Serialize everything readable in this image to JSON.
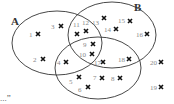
{
  "diagram": {
    "type": "venn",
    "sets": [
      {
        "id": "A",
        "label": "A",
        "cx": 57,
        "cy": 43,
        "rx": 45,
        "ry": 32,
        "label_x": 11,
        "label_y": 25
      },
      {
        "id": "B",
        "label": "B",
        "cx": 112,
        "cy": 35,
        "rx": 44,
        "ry": 33,
        "label_x": 134,
        "label_y": 11
      },
      {
        "id": "C",
        "label": "",
        "cx": 98,
        "cy": 68,
        "rx": 43,
        "ry": 31,
        "label_x": 0,
        "label_y": 0
      }
    ],
    "points": [
      {
        "n": "1",
        "x": 38,
        "y": 34,
        "tx": 29,
        "ty": 37
      },
      {
        "n": "2",
        "x": 43,
        "y": 59,
        "tx": 33,
        "ty": 62
      },
      {
        "n": "3",
        "x": 61,
        "y": 26,
        "tx": 51,
        "ty": 29
      },
      {
        "n": "4",
        "x": 66,
        "y": 62,
        "tx": 57,
        "ty": 65
      },
      {
        "n": "5",
        "x": 79,
        "y": 77,
        "tx": 69,
        "ty": 84
      },
      {
        "n": "6",
        "x": 88,
        "y": 87,
        "tx": 78,
        "ty": 92
      },
      {
        "n": "7",
        "x": 102,
        "y": 78,
        "tx": 93,
        "ty": 80
      },
      {
        "n": "8",
        "x": 120,
        "y": 78,
        "tx": 111,
        "ty": 81
      },
      {
        "n": "9",
        "x": 93,
        "y": 44,
        "tx": 83,
        "ty": 47
      },
      {
        "n": "10",
        "x": 92,
        "y": 54,
        "tx": 79,
        "ty": 57
      },
      {
        "n": "11",
        "x": 77,
        "y": 34,
        "tx": 73,
        "ty": 27
      },
      {
        "n": "12",
        "x": 86,
        "y": 31,
        "tx": 82,
        "ty": 25
      },
      {
        "n": "13",
        "x": 104,
        "y": 18,
        "tx": 92,
        "ty": 25
      },
      {
        "n": "14",
        "x": 116,
        "y": 29,
        "tx": 104,
        "ty": 32
      },
      {
        "n": "15",
        "x": 130,
        "y": 21,
        "tx": 118,
        "ty": 23
      },
      {
        "n": "16",
        "x": 147,
        "y": 34,
        "tx": 136,
        "ty": 37
      },
      {
        "n": "17",
        "x": 103,
        "y": 62,
        "tx": 94,
        "ty": 65
      },
      {
        "n": "18",
        "x": 129,
        "y": 59,
        "tx": 118,
        "ty": 62
      },
      {
        "n": "19",
        "x": 161,
        "y": 87,
        "tx": 150,
        "ty": 90
      },
      {
        "n": "20",
        "x": 161,
        "y": 62,
        "tx": 150,
        "ty": 65
      }
    ],
    "caption": "...”"
  }
}
